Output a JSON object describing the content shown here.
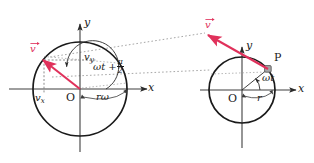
{
  "figure": {
    "colors": {
      "vector_red": "#e0315b",
      "curve_black": "#1a1a1a",
      "axis_black": "#4d4d4d",
      "dotted_grey": "#8c8c8c",
      "dashed_grey": "#6e6e6e",
      "background": "#ffffff"
    },
    "left_panel": {
      "name": "velocity-space-diagram",
      "axis_y_label": "y",
      "axis_x_label": "x",
      "origin_label": "O",
      "vector_label": "v",
      "component_x_label": "v",
      "component_x_sub": "x",
      "component_y_label": "v",
      "component_y_sub": "y",
      "angle_label": "ωt +",
      "angle_fraction_numerator": "π",
      "angle_fraction_denominator": "2",
      "radius_label": "rω"
    },
    "right_panel": {
      "name": "position-space-diagram",
      "axis_y_label": "y",
      "axis_x_label": "x",
      "origin_label": "O",
      "vector_label": "v",
      "point_label": "P",
      "angle_label": "ωt",
      "radius_label": "r"
    }
  }
}
